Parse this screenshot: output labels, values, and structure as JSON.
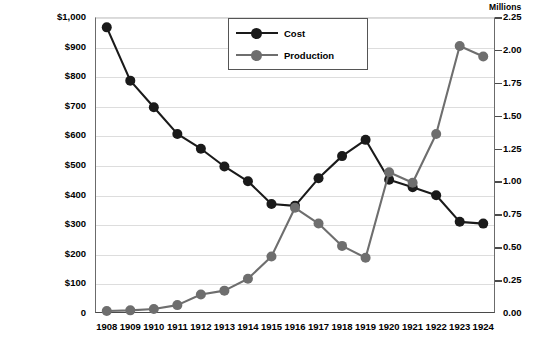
{
  "chart_data": {
    "type": "line",
    "title": "",
    "xlabel": "",
    "categories": [
      "1908",
      "1909",
      "1910",
      "1911",
      "1912",
      "1913",
      "1914",
      "1915",
      "1916",
      "1917",
      "1918",
      "1919",
      "1920",
      "1921",
      "1922",
      "1923",
      "1924"
    ],
    "grid": true,
    "legend_position": "top-right",
    "series": [
      {
        "name": "Cost",
        "axis": "left",
        "color": "#1a1a1a",
        "marker": "circle",
        "values": [
          965,
          785,
          695,
          605,
          555,
          495,
          445,
          368,
          362,
          455,
          530,
          585,
          450,
          425,
          398,
          308,
          302
        ]
      },
      {
        "name": "Production",
        "axis": "right",
        "color": "#6e6e6e",
        "marker": "circle",
        "values": [
          0.015,
          0.02,
          0.03,
          0.06,
          0.14,
          0.17,
          0.26,
          0.43,
          0.8,
          0.68,
          0.51,
          0.42,
          1.07,
          0.99,
          1.36,
          2.03,
          1.95
        ]
      }
    ],
    "left_axis": {
      "label": "",
      "ylim": [
        0,
        1000
      ],
      "tick_values": [
        0,
        100,
        200,
        300,
        400,
        500,
        600,
        700,
        800,
        900,
        1000
      ],
      "tick_labels": [
        "0",
        "$100",
        "$200",
        "$300",
        "$400",
        "$500",
        "$600",
        "$700",
        "$800",
        "$900",
        "$1,000"
      ]
    },
    "right_axis": {
      "label": "Millions",
      "ylim": [
        0,
        2.25
      ],
      "tick_values": [
        0,
        0.25,
        0.5,
        0.75,
        1.0,
        1.25,
        1.5,
        1.75,
        2.0,
        2.25
      ],
      "tick_labels": [
        "0.00",
        "0.25",
        "0.50",
        "0.75",
        "1.00",
        "1.25",
        "1.50",
        "1.75",
        "2.00",
        "2.25"
      ]
    }
  },
  "legend": {
    "items": [
      {
        "label": "Cost",
        "color": "#1a1a1a"
      },
      {
        "label": "Production",
        "color": "#6e6e6e"
      }
    ]
  }
}
